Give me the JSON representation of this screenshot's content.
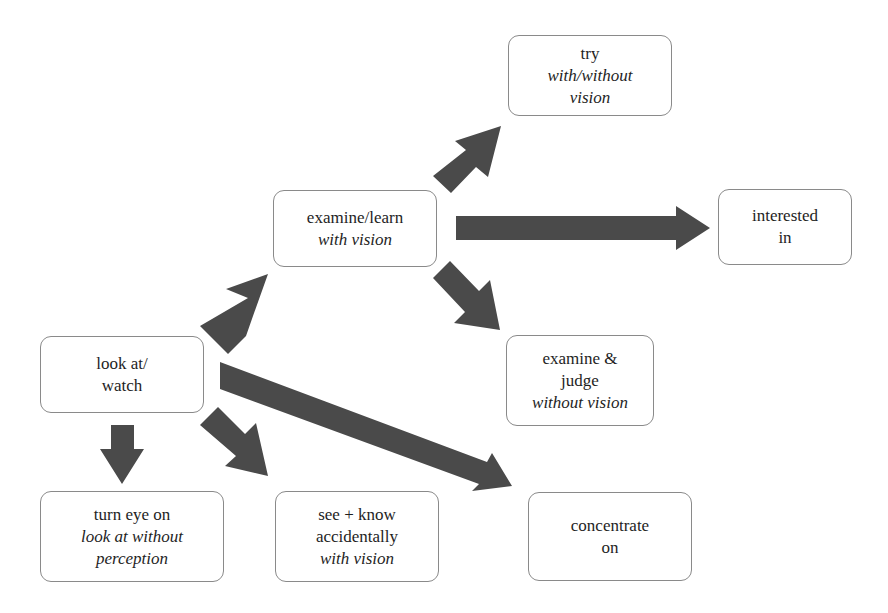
{
  "diagram": {
    "type": "flow diagram",
    "colors": {
      "arrow_fill": "#4a4a4a",
      "box_border": "#8a8a8a",
      "text": "#1e1e1e",
      "background": "#ffffff"
    },
    "nodes": {
      "look_at": {
        "lines": [
          "look at/",
          "watch"
        ],
        "italic": [
          false,
          false
        ]
      },
      "examine_learn": {
        "lines": [
          "examine/learn",
          "with vision"
        ],
        "italic": [
          false,
          true
        ]
      },
      "try": {
        "lines": [
          "try",
          "with/without",
          "vision"
        ],
        "italic": [
          false,
          true,
          true
        ]
      },
      "interested_in": {
        "lines": [
          "interested",
          "in"
        ],
        "italic": [
          false,
          false
        ]
      },
      "examine_judge": {
        "lines": [
          "examine &",
          "judge",
          "without vision"
        ],
        "italic": [
          false,
          false,
          true
        ]
      },
      "turn_eye_on": {
        "lines": [
          "turn eye on",
          "look at without",
          "perception"
        ],
        "italic": [
          false,
          true,
          true
        ]
      },
      "see_know": {
        "lines": [
          "see + know",
          "accidentally",
          "with vision"
        ],
        "italic": [
          false,
          false,
          true
        ]
      },
      "concentrate_on": {
        "lines": [
          "concentrate",
          "on"
        ],
        "italic": [
          false,
          false
        ]
      }
    },
    "edges": [
      {
        "from": "look at/ watch",
        "to": "examine/learn with vision",
        "direction": "up-right"
      },
      {
        "from": "look at/ watch",
        "to": "turn eye on look at without perception",
        "direction": "down"
      },
      {
        "from": "look at/ watch",
        "to": "see + know accidentally with vision",
        "direction": "down-right"
      },
      {
        "from": "look at/ watch",
        "to": "concentrate on",
        "direction": "down-right (long)"
      },
      {
        "from": "examine/learn with vision",
        "to": "try with/without vision",
        "direction": "up-right"
      },
      {
        "from": "examine/learn with vision",
        "to": "interested in",
        "direction": "right (long)"
      },
      {
        "from": "examine/learn with vision",
        "to": "examine & judge without vision",
        "direction": "down-right"
      }
    ]
  }
}
